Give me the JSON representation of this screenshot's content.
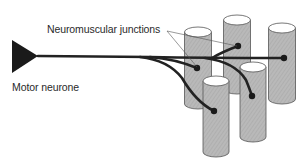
{
  "figure": {
    "labels": {
      "neuromuscular_junctions": "Neuromuscular junctions",
      "motor_neurone": "Motor neurone"
    },
    "colors": {
      "background": "#ffffff",
      "muscle_fibre_fill": "#b8b8b8",
      "muscle_fibre_top": "#ffffff",
      "outline": "#555555",
      "axon": "#222222",
      "text": "#2a2a2a"
    },
    "muscle_fibres": [
      {
        "id": "fibre-1",
        "cx": 198,
        "top": 32,
        "bottom": 104,
        "rx": 13.5,
        "ry": 5
      },
      {
        "id": "fibre-2",
        "cx": 237,
        "top": 20,
        "bottom": 89,
        "rx": 13.5,
        "ry": 5
      },
      {
        "id": "fibre-3",
        "cx": 282,
        "top": 28,
        "bottom": 99,
        "rx": 13.5,
        "ry": 5
      },
      {
        "id": "fibre-4",
        "cx": 253,
        "top": 67,
        "bottom": 137,
        "rx": 13,
        "ry": 5
      },
      {
        "id": "fibre-5",
        "cx": 216,
        "top": 81,
        "bottom": 152,
        "rx": 13,
        "ry": 5
      }
    ],
    "junctions": [
      {
        "id": "junction-1",
        "x": 197,
        "y": 68
      },
      {
        "id": "junction-2",
        "x": 238,
        "y": 46
      },
      {
        "id": "junction-3",
        "x": 284,
        "y": 58
      },
      {
        "id": "junction-4",
        "x": 252,
        "y": 96
      },
      {
        "id": "junction-5",
        "x": 214,
        "y": 111
      }
    ]
  }
}
